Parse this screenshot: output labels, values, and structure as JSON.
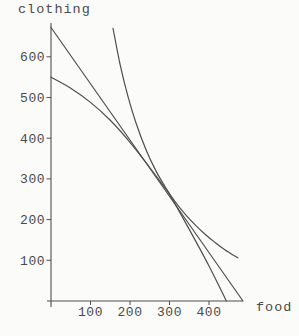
{
  "figure": {
    "background": "#fbfbfa",
    "ink_color": "#4a4a4a",
    "curve_color": "#4f4f4f"
  },
  "chart_data": {
    "type": "line",
    "title": "",
    "xlabel": "food",
    "ylabel": "clothing",
    "xlim": [
      0,
      490
    ],
    "ylim": [
      0,
      690
    ],
    "grid": false,
    "legend": "none",
    "x_ticks": [
      100,
      200,
      300,
      400
    ],
    "y_ticks": [
      100,
      200,
      300,
      400,
      500,
      600
    ],
    "tangency_point": [
      277,
      295
    ],
    "series": [
      {
        "name": "budget-line",
        "shape": "straight",
        "points": [
          [
            0,
            672
          ],
          [
            486,
            0
          ]
        ]
      },
      {
        "name": "concave-curve",
        "shape": "concave",
        "points": [
          [
            0,
            550
          ],
          [
            50,
            523
          ],
          [
            100,
            488
          ],
          [
            150,
            444
          ],
          [
            200,
            390
          ],
          [
            250,
            328
          ],
          [
            280,
            289
          ],
          [
            300,
            262
          ],
          [
            350,
            176
          ],
          [
            400,
            86
          ],
          [
            444,
            0
          ]
        ]
      },
      {
        "name": "convex-indifference-curve",
        "shape": "convex",
        "points": [
          [
            157,
            670
          ],
          [
            175,
            581
          ],
          [
            195,
            502
          ],
          [
            215,
            438
          ],
          [
            240,
            373
          ],
          [
            265,
            321
          ],
          [
            290,
            279
          ],
          [
            315,
            243
          ],
          [
            340,
            213
          ],
          [
            365,
            187
          ],
          [
            390,
            164
          ],
          [
            415,
            144
          ],
          [
            440,
            126
          ],
          [
            473,
            106
          ]
        ]
      }
    ]
  }
}
